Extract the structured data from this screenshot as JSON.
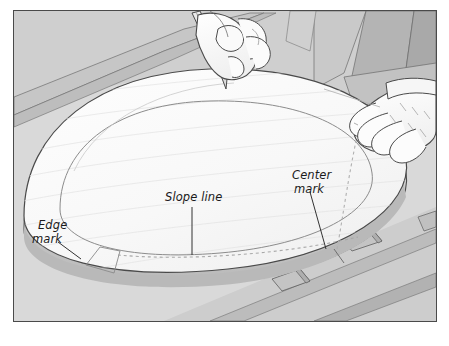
{
  "figure": {
    "border_color": "#4a4a4a",
    "background_color": "#d9d9d9",
    "page_background": "#ffffff"
  },
  "palette": {
    "panel_face": "#fafafa",
    "panel_face_shade": "#f2f2f2",
    "panel_edge_light": "#e4e4e4",
    "panel_edge_dark": "#bfbfbf",
    "bench_light": "#d2d2d2",
    "bench_mid": "#c6c6c6",
    "bench_dark": "#b3b3b3",
    "bench_darker": "#a3a3a3",
    "outline": "#4a4a4a",
    "line_soft": "#9a9a9a",
    "dash_line": "#a8a8a8",
    "skin": "#fcfcfc",
    "pencil_body": "#eaeaea"
  },
  "callouts": [
    {
      "id": "edge-mark",
      "lines": [
        "Edge",
        "mark"
      ],
      "text_x": 33,
      "text_y": 226,
      "leader": {
        "x1": 56,
        "y1": 240,
        "x2": 79,
        "y2": 257
      }
    },
    {
      "id": "slope-line",
      "lines": [
        "Slope line"
      ],
      "text_x": 163,
      "text_y": 196,
      "leader": {
        "x1": 190,
        "y1": 205,
        "x2": 190,
        "y2": 253
      }
    },
    {
      "id": "center-mark",
      "lines": [
        "Center",
        "mark"
      ],
      "text_x": 291,
      "text_y": 175,
      "leader": {
        "x1": 308,
        "y1": 190,
        "x2": 324,
        "y2": 247
      }
    }
  ],
  "scene": {
    "workpiece": "oval wood panel",
    "tool": "pencil",
    "hands": [
      "left hand holding pencil",
      "right hand steadying panel"
    ],
    "layout_lines": [
      "inner oval layout line",
      "dashed slope line",
      "dashed center curve"
    ],
    "bench_blocks_count": 2
  }
}
